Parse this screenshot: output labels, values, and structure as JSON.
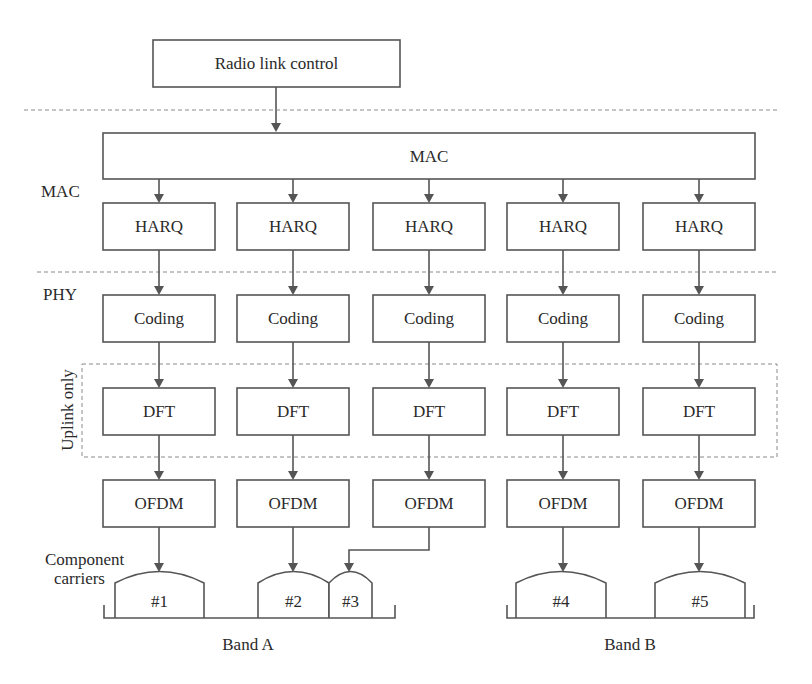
{
  "top_box": {
    "label": "Radio link control"
  },
  "mac_box": {
    "label": "MAC"
  },
  "side_labels": {
    "mac": "MAC",
    "phy": "PHY",
    "uplink": "Uplink only",
    "component_carriers_line1": "Component",
    "component_carriers_line2": "carriers"
  },
  "columns": [
    {
      "harq": "HARQ",
      "coding": "Coding",
      "dft": "DFT",
      "ofdm": "OFDM",
      "target_carrier": "#1"
    },
    {
      "harq": "HARQ",
      "coding": "Coding",
      "dft": "DFT",
      "ofdm": "OFDM",
      "target_carrier": "#2"
    },
    {
      "harq": "HARQ",
      "coding": "Coding",
      "dft": "DFT",
      "ofdm": "OFDM",
      "target_carrier": "#3"
    },
    {
      "harq": "HARQ",
      "coding": "Coding",
      "dft": "DFT",
      "ofdm": "OFDM",
      "target_carrier": "#4"
    },
    {
      "harq": "HARQ",
      "coding": "Coding",
      "dft": "DFT",
      "ofdm": "OFDM",
      "target_carrier": "#5"
    }
  ],
  "carriers": [
    "#1",
    "#2",
    "#3",
    "#4",
    "#5"
  ],
  "bands": [
    {
      "label": "Band A",
      "carriers": [
        "#1",
        "#2",
        "#3"
      ]
    },
    {
      "label": "Band B",
      "carriers": [
        "#4",
        "#5"
      ]
    }
  ],
  "colors": {
    "stroke": "#555555",
    "dashed": "#8a8a8a",
    "text": "#2a2a2a",
    "background": "#ffffff"
  }
}
